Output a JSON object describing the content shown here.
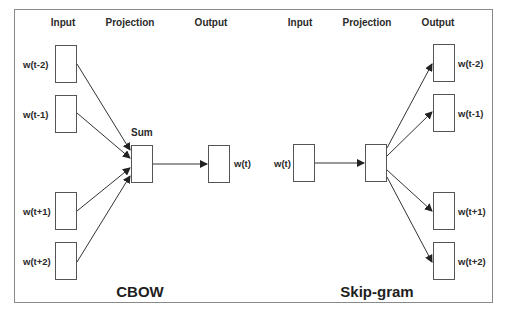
{
  "cbow": {
    "title": "CBOW",
    "headers": {
      "input": "Input",
      "projection": "Projection",
      "output": "Output"
    },
    "projection_label": "Sum",
    "inputs": [
      "w(t-2)",
      "w(t-1)",
      "w(t+1)",
      "w(t+2)"
    ],
    "output": "w(t)"
  },
  "skipgram": {
    "title": "Skip-gram",
    "headers": {
      "input": "Input",
      "projection": "Projection",
      "output": "Output"
    },
    "input": "w(t)",
    "outputs": [
      "w(t-2)",
      "w(t-1)",
      "w(t+1)",
      "w(t+2)"
    ]
  },
  "colors": {
    "line": "#333333",
    "border": "#8a8a8a",
    "box_border": "#555555"
  }
}
